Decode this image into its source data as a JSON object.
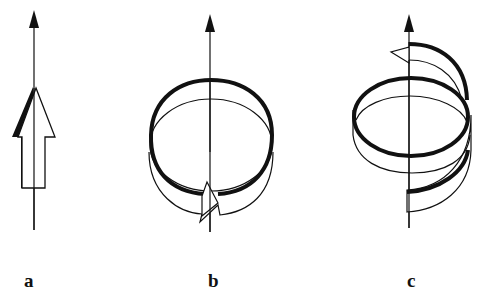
{
  "figure": {
    "panels": [
      {
        "id": "a",
        "label": "a",
        "description": "straight arrow along axis"
      },
      {
        "id": "b",
        "label": "b",
        "description": "circular ribbon arrow around axis"
      },
      {
        "id": "c",
        "label": "c",
        "description": "helical ribbon arrow around axis"
      }
    ],
    "colors": {
      "stroke": "#111111",
      "background": "#ffffff"
    }
  }
}
